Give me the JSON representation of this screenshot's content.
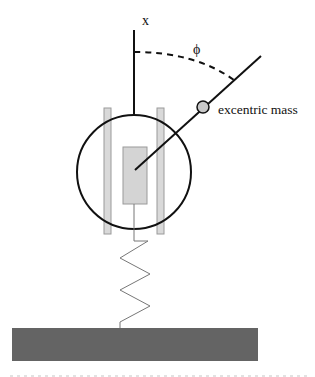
{
  "diagram": {
    "type": "mechanical-schematic",
    "labels": {
      "axis": "x",
      "angle": "ϕ",
      "mass": "excentric mass"
    },
    "colors": {
      "stroke": "#111111",
      "rail_fill": "#d9d9d9",
      "rail_stroke": "#9a9a9a",
      "inner_block_fill": "#d4d4d4",
      "mass_fill": "#c8c8c8",
      "ground_fill": "#646464",
      "spring_stroke": "#777777"
    },
    "components": [
      "vertical x-axis line",
      "dashed angle arc",
      "rotating arm",
      "excentric mass",
      "outer circle (rotor housing)",
      "left guide rail",
      "right guide rail",
      "inner block",
      "spring",
      "ground base"
    ]
  }
}
